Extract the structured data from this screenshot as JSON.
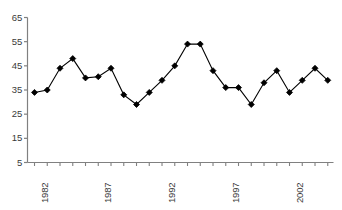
{
  "chart_data": {
    "type": "line",
    "title": "",
    "subtitle": "",
    "xlabel": "",
    "ylabel": "",
    "x": [
      1982,
      1983,
      1984,
      1985,
      1986,
      1987,
      1988,
      1989,
      1990,
      1991,
      1992,
      1993,
      1994,
      1995,
      1996,
      1997,
      1998,
      1999,
      2000,
      2001,
      2002,
      2003,
      2004,
      2005
    ],
    "categories": [
      "1982",
      "1983",
      "1984",
      "1985",
      "1986",
      "1987",
      "1988",
      "1989",
      "1990",
      "1991",
      "1992",
      "1993",
      "1994",
      "1995",
      "1996",
      "1997",
      "1998",
      "1999",
      "2000",
      "2001",
      "2002",
      "2003",
      "2004",
      "2005"
    ],
    "values": [
      34,
      35,
      44,
      48,
      40,
      40.5,
      44,
      33,
      29,
      34,
      39,
      45,
      54,
      54,
      43,
      36,
      36,
      29,
      38,
      43,
      34,
      39,
      44,
      39
    ],
    "series": [
      {
        "name": "series-1",
        "values": [
          34,
          35,
          44,
          48,
          40,
          40.5,
          44,
          33,
          29,
          34,
          39,
          45,
          54,
          54,
          43,
          36,
          36,
          29,
          38,
          43,
          34,
          39,
          44,
          39
        ],
        "color": "#000000",
        "marker": "diamond"
      }
    ],
    "ylim": [
      5,
      65
    ],
    "yticks": [
      5,
      15,
      25,
      35,
      45,
      55,
      65
    ],
    "ytick_labels": [
      "5",
      "15",
      "25",
      "35",
      "45",
      "55",
      "65"
    ],
    "xtick_labels": [
      "1982",
      "1987",
      "1992",
      "1997",
      "2002"
    ],
    "xtick_years": [
      1982,
      1987,
      1992,
      1997,
      2002
    ],
    "grid": false,
    "legend": false,
    "legend_position": "none",
    "axis_color": "#808080",
    "line_color": "#333333",
    "marker_color": "#000000",
    "background_color": "#ffffff"
  }
}
